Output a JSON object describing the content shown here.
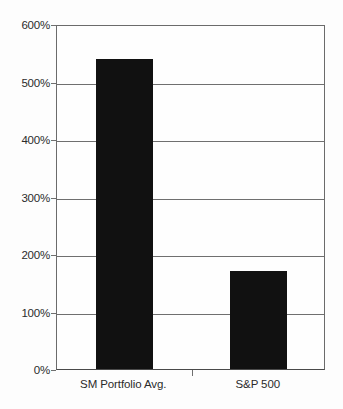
{
  "chart_data": {
    "type": "bar",
    "title": "",
    "subtitle": "",
    "xlabel": "",
    "ylabel": "",
    "categories": [
      "SM Portfolio Avg.",
      "S&P 500"
    ],
    "values": [
      540,
      170
    ],
    "value_labels": [
      "540%",
      "170%"
    ],
    "ylim": [
      0,
      600
    ],
    "ytick_values": [
      0,
      100,
      200,
      300,
      400,
      500,
      600
    ],
    "ytick_labels": [
      "0%",
      "100%",
      "200%",
      "300%",
      "400%",
      "500%",
      "600%"
    ],
    "grid": true,
    "grid_axis": "y",
    "legend": false,
    "legend_position": "none",
    "bar_color": "#111111",
    "grid_color": "#6f6f6f",
    "axis_color": "#4a4a4a",
    "background_color": "#fdfdfd",
    "text_color": "#2b2b2b"
  },
  "axes": {
    "y": {
      "ticks": [
        {
          "label": "600%",
          "value": 600
        },
        {
          "label": "500%",
          "value": 500
        },
        {
          "label": "400%",
          "value": 400
        },
        {
          "label": "300%",
          "value": 300
        },
        {
          "label": "200%",
          "value": 200
        },
        {
          "label": "100%",
          "value": 100
        },
        {
          "label": "0%",
          "value": 0
        }
      ]
    },
    "x": {
      "ticks": [
        {
          "label": "SM Portfolio Avg."
        },
        {
          "label": "S&P 500"
        }
      ]
    }
  }
}
